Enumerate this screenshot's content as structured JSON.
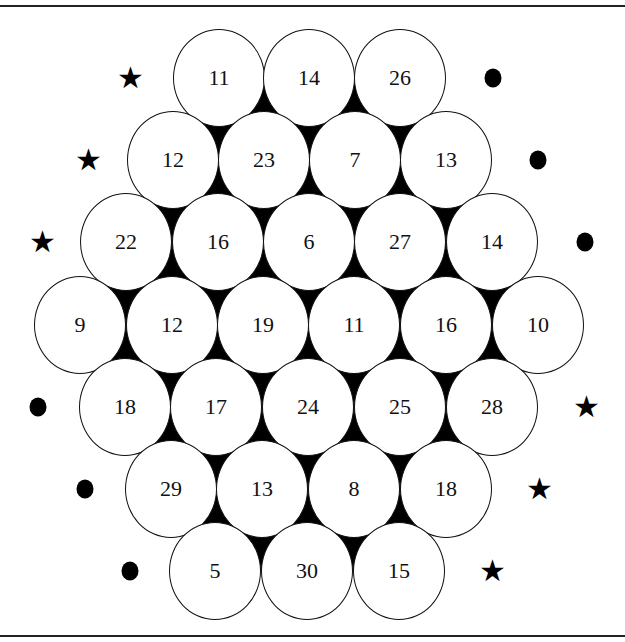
{
  "puzzle": {
    "layout": "hexagonal honeycomb of numbered circles with star and dot markers at row ends",
    "rows": [
      {
        "y": 78,
        "left_marker": "star",
        "left_x": 130,
        "right_marker": "dot",
        "right_x": 493,
        "cells": [
          {
            "x": 219,
            "value": "11"
          },
          {
            "x": 309,
            "value": "14"
          },
          {
            "x": 400,
            "value": "26"
          }
        ]
      },
      {
        "y": 160,
        "left_marker": "star",
        "left_x": 88,
        "right_marker": "dot",
        "right_x": 538,
        "cells": [
          {
            "x": 173,
            "value": "12"
          },
          {
            "x": 264,
            "value": "23"
          },
          {
            "x": 355,
            "value": "7"
          },
          {
            "x": 446,
            "value": "13"
          }
        ]
      },
      {
        "y": 242,
        "left_marker": "star",
        "left_x": 42,
        "right_marker": "dot",
        "right_x": 585,
        "cells": [
          {
            "x": 126,
            "value": "22"
          },
          {
            "x": 218,
            "value": "16"
          },
          {
            "x": 309,
            "value": "6"
          },
          {
            "x": 400,
            "value": "27"
          },
          {
            "x": 492,
            "value": "14"
          }
        ]
      },
      {
        "y": 325,
        "left_marker": null,
        "left_x": null,
        "right_marker": null,
        "right_x": null,
        "cells": [
          {
            "x": 80,
            "value": "9"
          },
          {
            "x": 172,
            "value": "12"
          },
          {
            "x": 263,
            "value": "19"
          },
          {
            "x": 354,
            "value": "11"
          },
          {
            "x": 446,
            "value": "16"
          },
          {
            "x": 538,
            "value": "10"
          }
        ]
      },
      {
        "y": 407,
        "left_marker": "dot",
        "left_x": 38,
        "right_marker": "star",
        "right_x": 586,
        "cells": [
          {
            "x": 125,
            "value": "18"
          },
          {
            "x": 216,
            "value": "17"
          },
          {
            "x": 308,
            "value": "24"
          },
          {
            "x": 400,
            "value": "25"
          },
          {
            "x": 492,
            "value": "28"
          }
        ]
      },
      {
        "y": 489,
        "left_marker": "dot",
        "left_x": 85,
        "right_marker": "star",
        "right_x": 539,
        "cells": [
          {
            "x": 171,
            "value": "29"
          },
          {
            "x": 262,
            "value": "13"
          },
          {
            "x": 354,
            "value": "8"
          },
          {
            "x": 446,
            "value": "18"
          }
        ]
      },
      {
        "y": 571,
        "left_marker": "dot",
        "left_x": 130,
        "right_marker": "star",
        "right_x": 492,
        "cells": [
          {
            "x": 215,
            "value": "5"
          },
          {
            "x": 307,
            "value": "30"
          },
          {
            "x": 399,
            "value": "15"
          }
        ]
      }
    ],
    "markers": {
      "star": "★",
      "dot": "●"
    },
    "colors": {
      "background": "#ffffff",
      "gap_fill": "#000000",
      "circle_stroke": "#111111",
      "text": "#111111"
    }
  }
}
